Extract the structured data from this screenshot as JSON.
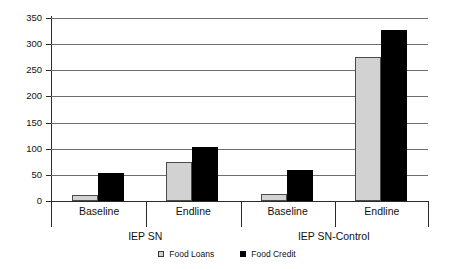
{
  "chart_data": {
    "type": "bar",
    "title": "",
    "subtitle": "",
    "xlabel": "",
    "ylabel": "",
    "ylim": [
      0,
      350
    ],
    "ytick_step": 50,
    "yticks": [
      0,
      50,
      100,
      150,
      200,
      250,
      300,
      350
    ],
    "ytick_labels": [
      "0",
      "50",
      "100",
      "150",
      "200",
      "250",
      "300",
      "350"
    ],
    "grid": true,
    "legend_position": "bottom",
    "groups": [
      {
        "name": "IEP SN",
        "categories": [
          "Baseline",
          "Endline"
        ]
      },
      {
        "name": "IEP SN-Control",
        "categories": [
          "Baseline",
          "Endline"
        ]
      }
    ],
    "categories": [
      "Baseline",
      "Endline",
      "Baseline",
      "Endline"
    ],
    "series": [
      {
        "name": "Food Loans",
        "color": "#d2d2d2",
        "values": [
          11,
          74,
          14,
          276
        ]
      },
      {
        "name": "Food Credit",
        "color": "#000000",
        "values": [
          53,
          104,
          60,
          327
        ]
      }
    ]
  },
  "legend": {
    "items": [
      {
        "label": "Food Loans",
        "marker": "square-light-marker"
      },
      {
        "label": "Food Credit",
        "marker": "square-black-marker"
      }
    ]
  },
  "colors": {
    "loans": "#d2d2d2",
    "credit": "#000000",
    "axis": "#2b2b2b",
    "grid": "#6e6e6e",
    "background": "#ffffff"
  }
}
